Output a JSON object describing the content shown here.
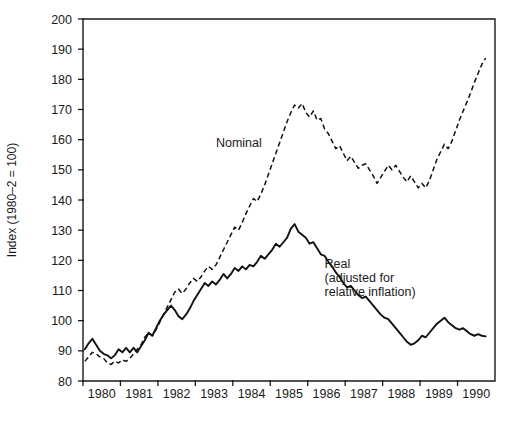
{
  "chart_data": {
    "type": "line",
    "title": "",
    "xlabel": "",
    "ylabel": "Index (1980–2 = 100)",
    "ylim": [
      80,
      200
    ],
    "xlim": [
      1979.5,
      1990.5
    ],
    "grid": false,
    "legend_position": "inline-annotations",
    "y_ticks": [
      80,
      90,
      100,
      110,
      120,
      130,
      140,
      150,
      160,
      170,
      180,
      190,
      200
    ],
    "y_tick_labels": [
      "80",
      "90",
      "100",
      "110",
      "120",
      "130",
      "140",
      "150",
      "160",
      "170",
      "180",
      "190",
      "200"
    ],
    "x_ticks": [
      1980,
      1981,
      1982,
      1983,
      1984,
      1985,
      1986,
      1987,
      1988,
      1989,
      1990
    ],
    "x_tick_labels": [
      "1980",
      "1981",
      "1982",
      "1983",
      "1984",
      "1985",
      "1986",
      "1987",
      "1988",
      "1989",
      "1990"
    ],
    "annotations": [
      {
        "text": "Nominal",
        "x": 1983.05,
        "y": 157.5
      },
      {
        "text": "Real",
        "x": 1985.95,
        "y": 117.5
      },
      {
        "text": "(adjusted for",
        "x": 1985.95,
        "y": 112.8
      },
      {
        "text": "relative inflation)",
        "x": 1985.95,
        "y": 108.1
      }
    ],
    "series": [
      {
        "name": "Nominal",
        "style": "dashed",
        "color": "#111111",
        "x": [
          1979.55,
          1979.65,
          1979.75,
          1979.85,
          1979.95,
          1980.05,
          1980.15,
          1980.25,
          1980.35,
          1980.45,
          1980.55,
          1980.65,
          1980.75,
          1980.85,
          1980.95,
          1981.05,
          1981.15,
          1981.25,
          1981.35,
          1981.45,
          1981.55,
          1981.65,
          1981.75,
          1981.85,
          1981.95,
          1982.05,
          1982.15,
          1982.25,
          1982.35,
          1982.45,
          1982.55,
          1982.65,
          1982.75,
          1982.85,
          1982.95,
          1983.05,
          1983.15,
          1983.25,
          1983.35,
          1983.45,
          1983.55,
          1983.65,
          1983.75,
          1983.85,
          1983.95,
          1984.05,
          1984.15,
          1984.25,
          1984.35,
          1984.45,
          1984.55,
          1984.65,
          1984.75,
          1984.85,
          1984.95,
          1985.05,
          1985.15,
          1985.25,
          1985.35,
          1985.45,
          1985.55,
          1985.65,
          1985.75,
          1985.85,
          1985.95,
          1986.05,
          1986.15,
          1986.25,
          1986.35,
          1986.45,
          1986.55,
          1986.65,
          1986.75,
          1986.85,
          1986.95,
          1987.05,
          1987.15,
          1987.25,
          1987.35,
          1987.45,
          1987.55,
          1987.65,
          1987.75,
          1987.85,
          1987.95,
          1988.05,
          1988.15,
          1988.25,
          1988.35,
          1988.45,
          1988.55,
          1988.65,
          1988.75,
          1988.85,
          1988.95,
          1989.05,
          1989.15,
          1989.25,
          1989.35,
          1989.45,
          1989.55,
          1989.65,
          1989.75,
          1989.85,
          1989.95,
          1990.05,
          1990.15,
          1990.25
        ],
        "values": [
          86.5,
          88.0,
          89.5,
          89.0,
          88.0,
          87.5,
          86.0,
          85.5,
          86.5,
          86.0,
          87.0,
          86.5,
          87.5,
          89.0,
          90.5,
          92.0,
          94.5,
          96.0,
          95.0,
          97.0,
          99.5,
          102.0,
          104.5,
          107.0,
          109.5,
          110.5,
          109.0,
          110.5,
          112.5,
          114.0,
          113.0,
          114.5,
          116.5,
          118.0,
          117.0,
          118.5,
          121.0,
          123.5,
          126.0,
          128.5,
          131.0,
          130.0,
          132.5,
          135.5,
          138.0,
          140.5,
          139.5,
          142.0,
          145.0,
          148.5,
          152.0,
          155.5,
          159.0,
          162.5,
          166.0,
          169.0,
          171.5,
          170.5,
          172.0,
          169.0,
          167.5,
          169.5,
          166.5,
          167.0,
          163.5,
          162.0,
          159.5,
          157.0,
          158.0,
          155.5,
          153.0,
          154.5,
          152.5,
          150.5,
          151.5,
          152.0,
          150.0,
          148.0,
          145.5,
          147.5,
          149.5,
          151.5,
          150.0,
          151.5,
          149.5,
          147.5,
          146.0,
          148.0,
          146.0,
          144.0,
          145.5,
          144.0,
          146.5,
          150.0,
          153.5,
          156.0,
          158.5,
          157.0,
          159.5,
          163.0,
          166.5,
          169.5,
          172.5,
          175.5,
          179.0,
          182.0,
          185.0,
          187.0
        ]
      },
      {
        "name": "Real (adjusted for relative inflation)",
        "style": "solid",
        "color": "#111111",
        "x": [
          1979.55,
          1979.65,
          1979.75,
          1979.85,
          1979.95,
          1980.05,
          1980.15,
          1980.25,
          1980.35,
          1980.45,
          1980.55,
          1980.65,
          1980.75,
          1980.85,
          1980.95,
          1981.05,
          1981.15,
          1981.25,
          1981.35,
          1981.45,
          1981.55,
          1981.65,
          1981.75,
          1981.85,
          1981.95,
          1982.05,
          1982.15,
          1982.25,
          1982.35,
          1982.45,
          1982.55,
          1982.65,
          1982.75,
          1982.85,
          1982.95,
          1983.05,
          1983.15,
          1983.25,
          1983.35,
          1983.45,
          1983.55,
          1983.65,
          1983.75,
          1983.85,
          1983.95,
          1984.05,
          1984.15,
          1984.25,
          1984.35,
          1984.45,
          1984.55,
          1984.65,
          1984.75,
          1984.85,
          1984.95,
          1985.05,
          1985.15,
          1985.25,
          1985.35,
          1985.45,
          1985.55,
          1985.65,
          1985.75,
          1985.85,
          1985.95,
          1986.05,
          1986.15,
          1986.25,
          1986.35,
          1986.45,
          1986.55,
          1986.65,
          1986.75,
          1986.85,
          1986.95,
          1987.05,
          1987.15,
          1987.25,
          1987.35,
          1987.45,
          1987.55,
          1987.65,
          1987.75,
          1987.85,
          1987.95,
          1988.05,
          1988.15,
          1988.25,
          1988.35,
          1988.45,
          1988.55,
          1988.65,
          1988.75,
          1988.85,
          1988.95,
          1989.05,
          1989.15,
          1989.25,
          1989.35,
          1989.45,
          1989.55,
          1989.65,
          1989.75,
          1989.85,
          1989.95,
          1990.05,
          1990.15,
          1990.25
        ],
        "values": [
          90.5,
          92.5,
          94.0,
          92.0,
          90.0,
          89.0,
          88.5,
          87.5,
          88.5,
          90.5,
          89.5,
          91.0,
          89.5,
          91.0,
          89.5,
          91.5,
          93.5,
          96.0,
          95.0,
          97.5,
          100.0,
          102.0,
          103.5,
          105.0,
          103.5,
          101.5,
          100.5,
          102.0,
          104.0,
          106.5,
          108.5,
          110.5,
          112.5,
          111.5,
          113.0,
          112.0,
          113.5,
          115.5,
          114.0,
          115.5,
          117.5,
          116.5,
          118.0,
          117.0,
          118.5,
          118.0,
          119.5,
          121.5,
          120.5,
          122.0,
          123.5,
          125.5,
          124.5,
          126.0,
          127.5,
          130.5,
          132.0,
          129.5,
          128.5,
          127.5,
          125.5,
          126.0,
          124.0,
          122.0,
          121.5,
          119.5,
          118.0,
          116.0,
          114.5,
          112.5,
          111.0,
          111.5,
          110.0,
          108.5,
          107.5,
          108.0,
          106.5,
          105.0,
          103.5,
          102.0,
          101.0,
          100.5,
          99.0,
          97.5,
          96.0,
          94.5,
          93.0,
          92.0,
          92.5,
          93.5,
          95.0,
          94.5,
          96.0,
          97.5,
          99.0,
          100.0,
          101.0,
          99.5,
          98.5,
          97.5,
          97.0,
          97.5,
          96.5,
          95.5,
          95.0,
          95.5,
          95.0,
          94.8
        ]
      }
    ]
  }
}
